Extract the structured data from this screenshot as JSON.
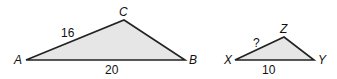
{
  "figure": {
    "colors": {
      "fill": "#e6e6e6",
      "stroke": "#222222",
      "text": "#111111"
    },
    "triangle_abc": {
      "vertices": {
        "A": "A",
        "B": "B",
        "C": "C"
      },
      "sides": {
        "AC": "16",
        "AB": "20"
      }
    },
    "triangle_xyz": {
      "vertices": {
        "X": "X",
        "Y": "Y",
        "Z": "Z"
      },
      "sides": {
        "XZ": "?",
        "XY": "10"
      }
    }
  }
}
